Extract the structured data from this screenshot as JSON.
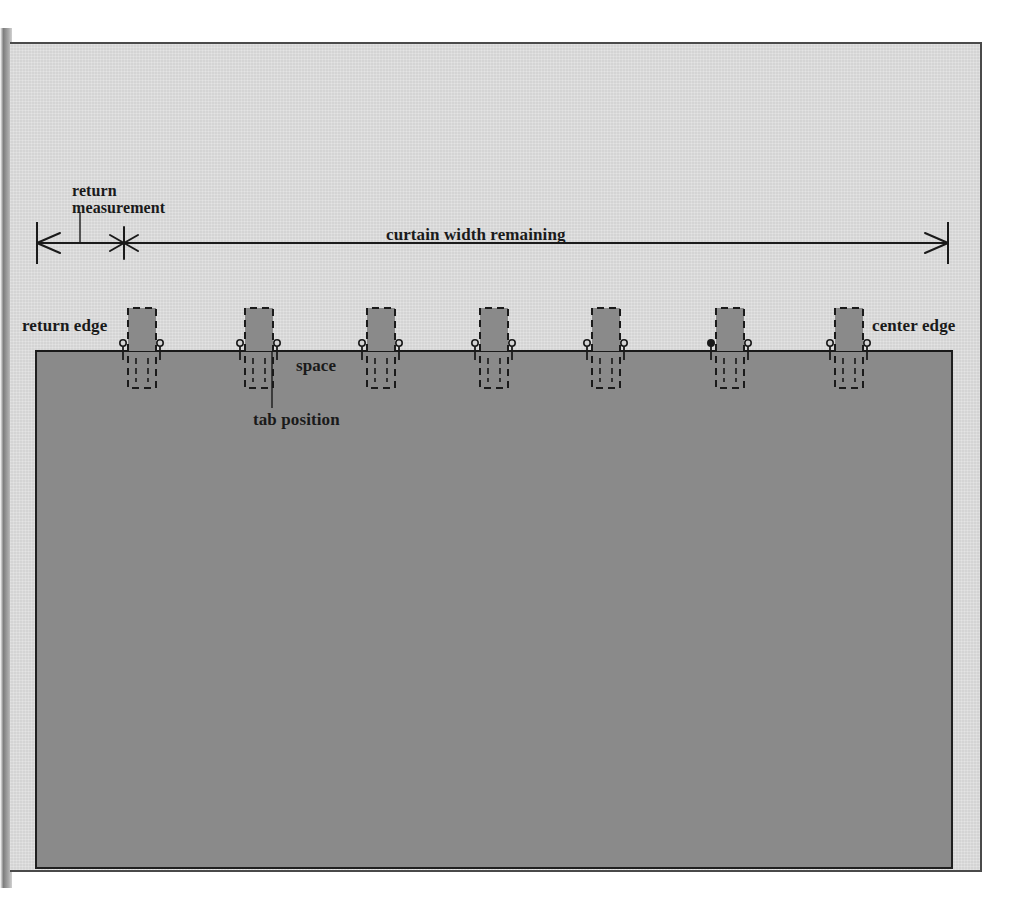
{
  "diagram": {
    "labels": {
      "return_measurement": "return\nmeasurement",
      "return_measurement_line1": "return",
      "return_measurement_line2": "measurement",
      "curtain_width_remaining": "curtain width remaining",
      "return_edge": "return edge",
      "center_edge": "center edge",
      "space": "space",
      "tab_position": "tab position"
    },
    "colors": {
      "paper": "#d4d4d4",
      "curtain_fill": "#8a8a8a",
      "tab_fill": "#8a8a8a",
      "ink": "#1a1a1a",
      "page_border": "#4a4a4a"
    },
    "geometry": {
      "page": {
        "x": 10,
        "y": 42,
        "width": 972,
        "height": 830
      },
      "dimension_line": {
        "y": 243,
        "left_tick_x": 37,
        "right_tick_x": 948,
        "asterisk_x": 124,
        "leader_x": 80,
        "leader_top_y": 212
      },
      "curtain": {
        "left": 36,
        "right": 952,
        "top": 351,
        "bottom": 868
      },
      "tab": {
        "width": 28,
        "top": 308,
        "dash_bottom": 388
      },
      "tab_positions": [
        128,
        245,
        367,
        480,
        592,
        716,
        835
      ],
      "tab_count": 7,
      "tab_position_leader": {
        "x": 272,
        "from_y": 351,
        "to_y": 408
      }
    }
  }
}
